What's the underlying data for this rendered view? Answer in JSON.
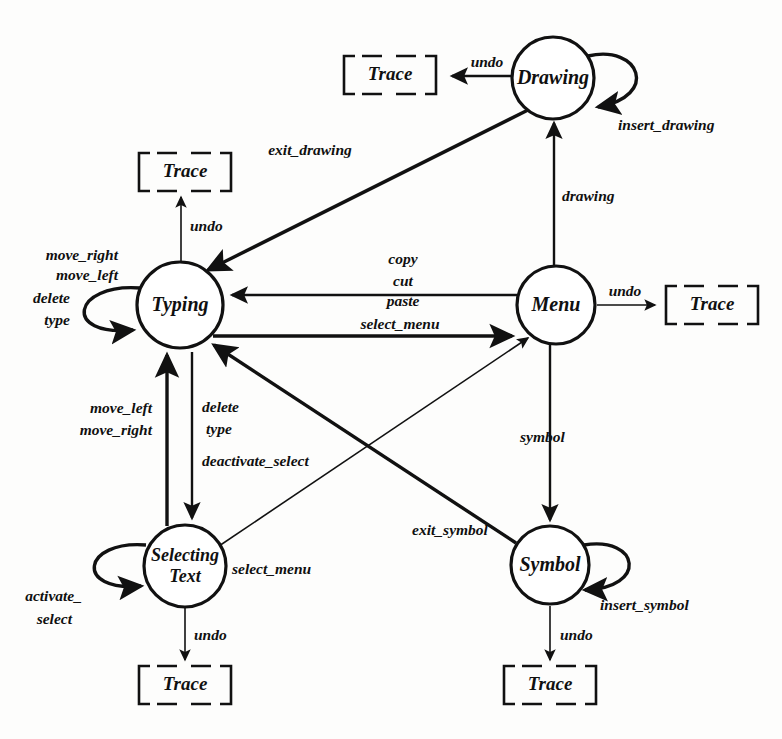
{
  "diagram": {
    "type": "state-machine",
    "ink_color": "#111111",
    "background_color": "#fdfdfc",
    "states": [
      {
        "id": "typing",
        "label": "Typing",
        "cx": 180,
        "cy": 305,
        "r": 43
      },
      {
        "id": "drawing",
        "label": "Drawing",
        "cx": 553,
        "cy": 78,
        "r": 41
      },
      {
        "id": "menu",
        "label": "Menu",
        "cx": 556,
        "cy": 305,
        "r": 39
      },
      {
        "id": "selecting",
        "label": "Selecting Text",
        "label_line1": "Selecting",
        "label_line2": "Text",
        "cx": 185,
        "cy": 566,
        "r": 41
      },
      {
        "id": "symbol",
        "label": "Symbol",
        "cx": 550,
        "cy": 565,
        "r": 39
      }
    ],
    "traces": [
      {
        "id": "trace-drawing",
        "label": "Trace",
        "cx": 390,
        "cy": 75,
        "w": 92,
        "h": 46
      },
      {
        "id": "trace-typing",
        "label": "Trace",
        "cx": 185,
        "cy": 172,
        "w": 92,
        "h": 46
      },
      {
        "id": "trace-menu",
        "label": "Trace",
        "cx": 712,
        "cy": 305,
        "w": 92,
        "h": 46
      },
      {
        "id": "trace-selecting",
        "label": "Trace",
        "cx": 185,
        "cy": 685,
        "w": 92,
        "h": 46
      },
      {
        "id": "trace-symbol",
        "label": "Trace",
        "cx": 550,
        "cy": 685,
        "w": 92,
        "h": 46
      }
    ],
    "transitions": [
      {
        "id": "t-drawing-undo",
        "from": "drawing",
        "to": "trace-drawing",
        "label": "undo"
      },
      {
        "id": "t-drawing-self",
        "from": "drawing",
        "to": "drawing",
        "label": "insert_drawing"
      },
      {
        "id": "t-drawing-exit",
        "from": "drawing",
        "to": "typing",
        "label": "exit_drawing"
      },
      {
        "id": "t-menu-drawing",
        "from": "menu",
        "to": "drawing",
        "label": "drawing"
      },
      {
        "id": "t-typing-undo",
        "from": "typing",
        "to": "trace-typing",
        "label": "undo"
      },
      {
        "id": "t-typing-self",
        "from": "typing",
        "to": "typing",
        "labels": [
          "move_right",
          "move_left",
          "delete",
          "type"
        ]
      },
      {
        "id": "t-menu-typing",
        "from": "menu",
        "to": "typing",
        "labels": [
          "copy",
          "cut",
          "paste"
        ]
      },
      {
        "id": "t-typing-menu",
        "from": "typing",
        "to": "menu",
        "label": "select_menu"
      },
      {
        "id": "t-menu-undo",
        "from": "menu",
        "to": "trace-menu",
        "label": "undo"
      },
      {
        "id": "t-selecting-typing",
        "from": "selecting",
        "to": "typing",
        "labels": [
          "move_left",
          "move_right"
        ]
      },
      {
        "id": "t-typing-selecting",
        "from": "typing",
        "to": "selecting",
        "labels": [
          "delete",
          "type",
          "deactivate_select"
        ]
      },
      {
        "id": "t-selecting-self",
        "from": "selecting",
        "to": "selecting",
        "labels": [
          "activate_",
          "select"
        ]
      },
      {
        "id": "t-selecting-undo",
        "from": "selecting",
        "to": "trace-selecting",
        "label": "undo"
      },
      {
        "id": "t-selecting-menu",
        "from": "selecting",
        "to": "menu",
        "label": "select_menu"
      },
      {
        "id": "t-menu-symbol",
        "from": "menu",
        "to": "symbol",
        "label": "symbol"
      },
      {
        "id": "t-symbol-typing",
        "from": "symbol",
        "to": "typing",
        "label": "exit_symbol"
      },
      {
        "id": "t-symbol-self",
        "from": "symbol",
        "to": "symbol",
        "label": "insert_symbol"
      },
      {
        "id": "t-symbol-undo",
        "from": "symbol",
        "to": "trace-symbol",
        "label": "undo"
      }
    ],
    "edge_labels": {
      "undo_drawing": "undo",
      "insert_drawing": "insert_drawing",
      "exit_drawing": "exit_drawing",
      "drawing": "drawing",
      "undo_typing": "undo",
      "move_right": "move_right",
      "move_left": "move_left",
      "delete": "delete",
      "type": "type",
      "copy": "copy",
      "cut": "cut",
      "paste": "paste",
      "select_menu_top": "select_menu",
      "undo_menu": "undo",
      "move_left_2": "move_left",
      "move_right_2": "move_right",
      "delete_2": "delete",
      "type_2": "type",
      "deactivate_select": "deactivate_select",
      "activate_1": "activate_",
      "activate_2": "select",
      "select_menu_diag": "select_menu",
      "symbol": "symbol",
      "exit_symbol": "exit_symbol",
      "insert_symbol": "insert_symbol",
      "undo_selecting": "undo",
      "undo_symbol": "undo"
    }
  }
}
